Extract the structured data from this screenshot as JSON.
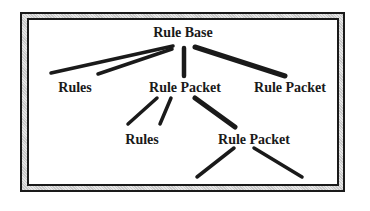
{
  "diagram": {
    "type": "tree",
    "nodes": [
      {
        "id": "root",
        "label": "Rule Base",
        "x": 183,
        "y": 24
      },
      {
        "id": "rules1",
        "label": "Rules",
        "x": 76,
        "y": 79
      },
      {
        "id": "packet1",
        "label": "Rule Packet",
        "x": 180,
        "y": 79
      },
      {
        "id": "packet2",
        "label": "Rule Packet",
        "x": 290,
        "y": 79
      },
      {
        "id": "rules2",
        "label": "Rules",
        "x": 143,
        "y": 131
      },
      {
        "id": "packet3",
        "label": "Rule Packet",
        "x": 254,
        "y": 131
      }
    ],
    "edges": [
      {
        "from": "root",
        "to": "rules1"
      },
      {
        "from": "root",
        "to": "rules1"
      },
      {
        "from": "root",
        "to": "packet1"
      },
      {
        "from": "root",
        "to": "packet2"
      },
      {
        "from": "packet1",
        "to": "rules2"
      },
      {
        "from": "packet1",
        "to": "rules2"
      },
      {
        "from": "packet1",
        "to": "packet3"
      },
      {
        "from": "packet3",
        "to": "unlabeled-left"
      },
      {
        "from": "packet3",
        "to": "unlabeled-right"
      }
    ]
  },
  "labels": {
    "root": "Rule Base",
    "rules1": "Rules",
    "packet1": "Rule Packet",
    "packet2": "Rule Packet",
    "rules2": "Rules",
    "packet3": "Rule Packet"
  },
  "colors": {
    "line": "#1a1a1a",
    "frame_fill": "#d4d4d4",
    "background": "#ffffff"
  }
}
